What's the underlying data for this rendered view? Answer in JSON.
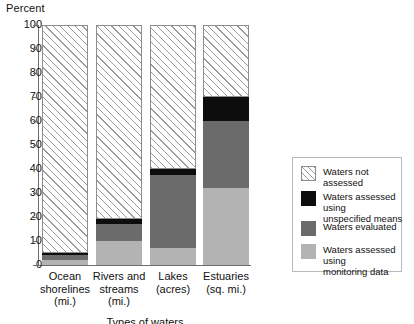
{
  "chart_data": {
    "type": "bar",
    "title": "",
    "ylabel": "Percent",
    "xlabel": "Types of waters",
    "ylim": [
      0,
      100
    ],
    "yticks": [
      0,
      10,
      20,
      30,
      40,
      50,
      60,
      70,
      80,
      90,
      100
    ],
    "grid": false,
    "stacked": true,
    "legend_position": "right",
    "categories": [
      "Ocean shorelines (mi.)",
      "Rivers and streams (mi.)",
      "Lakes (acres)",
      "Estuaries (sq. mi.)"
    ],
    "category_lines": [
      [
        "Ocean",
        "shorelines",
        "(mi.)"
      ],
      [
        "Rivers and",
        "streams",
        "(mi.)"
      ],
      [
        "Lakes",
        "(acres)"
      ],
      [
        "Estuaries",
        "(sq. mi.)"
      ]
    ],
    "series": [
      {
        "name": "Waters assessed using monitoring data",
        "key": "monitoring",
        "color": "#b3b3b3",
        "values": [
          2,
          10,
          7,
          32
        ]
      },
      {
        "name": "Waters evaluated",
        "key": "evaluated",
        "color": "#6b6b6b",
        "values": [
          2,
          7,
          30.5,
          28
        ]
      },
      {
        "name": "Waters assessed using unspecified means",
        "key": "unspecified",
        "color": "#0d0d0d",
        "values": [
          1,
          2,
          2.5,
          10
        ]
      },
      {
        "name": "Waters not assessed",
        "key": "not-assessed",
        "color": "#ffffff",
        "values": [
          95,
          81,
          60,
          30
        ]
      }
    ],
    "annotations": []
  },
  "axis": {
    "y_title": "Percent",
    "x_title": "Types of waters",
    "tick_labels": [
      "100",
      "90",
      "80",
      "70",
      "60",
      "50",
      "40",
      "30",
      "20",
      "10",
      "0"
    ]
  },
  "legend": {
    "entries": [
      {
        "label_line1": "Waters not assessed",
        "label_line2": "",
        "swatch": "not-assessed"
      },
      {
        "label_line1": "Waters assessed using",
        "label_line2": "unspecified means",
        "swatch": "unspecified"
      },
      {
        "label_line1": "Waters evaluated",
        "label_line2": "",
        "swatch": "evaluated"
      },
      {
        "label_line1": "Waters assessed using",
        "label_line2": "monitoring data",
        "swatch": "monitoring"
      }
    ]
  }
}
